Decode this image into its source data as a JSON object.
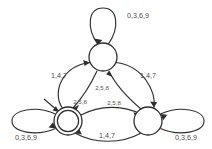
{
  "diagram": {
    "kind": "finite-state-automaton",
    "stroke_color": "#2e2e2e",
    "label_color": "#4a4a4a",
    "background_color": "#ffffff",
    "states": [
      {
        "id": "q_top",
        "name": "top-state",
        "label": "",
        "cx": 103,
        "cy": 57,
        "r": 14,
        "accepting": false,
        "start": false
      },
      {
        "id": "q_left",
        "name": "left-state-accepting",
        "label": "",
        "cx": 68,
        "cy": 121,
        "r": 14,
        "accepting": true,
        "start": true
      },
      {
        "id": "q_right",
        "name": "right-state",
        "label": "",
        "cx": 148,
        "cy": 121,
        "r": 14,
        "accepting": false,
        "start": false
      }
    ],
    "self_loops": [
      {
        "id": "loop_top",
        "state": "q_top",
        "label": "0,3,6,9",
        "label_x": 127,
        "label_y": 16
      },
      {
        "id": "loop_left",
        "state": "q_left",
        "label": "0,3,6,9",
        "label_x": 26,
        "label_y": 138
      },
      {
        "id": "loop_right",
        "state": "q_right",
        "label": "0,3,6,9",
        "label_x": 186,
        "label_y": 138
      }
    ],
    "transitions": [
      {
        "id": "t_left_to_top",
        "from": "q_left",
        "to": "q_top",
        "label": "1,4,7",
        "label_x": 59,
        "label_y": 76
      },
      {
        "id": "t_top_to_right",
        "from": "q_top",
        "to": "q_right",
        "label": "1,4,7",
        "label_x": 148,
        "label_y": 76
      },
      {
        "id": "t_right_to_left",
        "from": "q_right",
        "to": "q_left",
        "label": "1,4,7",
        "label_x": 107,
        "label_y": 136
      },
      {
        "id": "t_top_to_left",
        "from": "q_top",
        "to": "q_left",
        "label": "2,5,8",
        "label_x": 80,
        "label_y": 102
      },
      {
        "id": "t_right_to_top",
        "from": "q_right",
        "to": "q_top",
        "label": "2,5,8",
        "label_x": 102,
        "label_y": 88
      },
      {
        "id": "t_left_to_right",
        "from": "q_left",
        "to": "q_right",
        "label": "2,5,8",
        "label_x": 114,
        "label_y": 103
      }
    ],
    "start_arrow": {
      "id": "start_arrow",
      "name": "start-arrow",
      "target": "q_left"
    }
  }
}
